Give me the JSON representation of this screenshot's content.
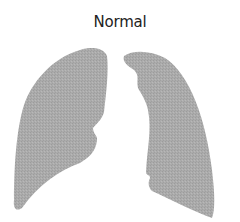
{
  "diagram": {
    "title": "Normal",
    "parts": [
      {
        "name": "left-lung"
      },
      {
        "name": "right-lung"
      }
    ],
    "colors": {
      "lung_fill": "#a9a9a9",
      "title_text": "#222222",
      "background": "#ffffff"
    }
  }
}
